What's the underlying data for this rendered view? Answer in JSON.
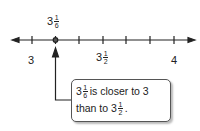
{
  "diagram": {
    "type": "number-line",
    "range": [
      3,
      4
    ],
    "tick_step": "1/6",
    "labels": [
      {
        "whole": "3",
        "num": "",
        "den": "",
        "position": 0
      },
      {
        "whole": "3",
        "num": "1",
        "den": "2",
        "position": 3
      },
      {
        "whole": "4",
        "num": "",
        "den": "",
        "position": 6
      }
    ],
    "point": {
      "whole": "3",
      "num": "1",
      "den": "6",
      "position": 1
    },
    "callout": {
      "line1_whole": "3",
      "line1_num": "1",
      "line1_den": "6",
      "line1_text": "is closer to 3",
      "line2_text": "than to 3",
      "line2_num": "1",
      "line2_den": "2",
      "line2_end": "."
    }
  }
}
